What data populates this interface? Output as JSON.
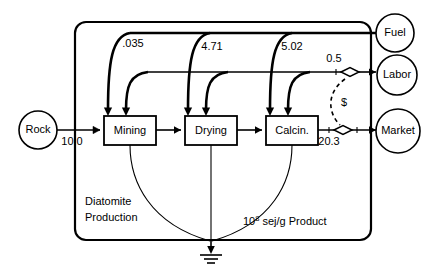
{
  "diagram": {
    "unit_note": {
      "base": "10",
      "exponent": "8",
      "suffix": " sej/g Product"
    },
    "system_boundary_label": "Diatomite Production",
    "caption_line1": "Diatomite",
    "caption_line2": "Production",
    "money_symbol": "$"
  },
  "sources": [
    {
      "id": "rock",
      "label": "Rock",
      "shape": "circle",
      "side": "left"
    },
    {
      "id": "fuel",
      "label": "Fuel",
      "shape": "circle",
      "side": "right"
    },
    {
      "id": "labor",
      "label": "Labor",
      "shape": "circle",
      "side": "right"
    },
    {
      "id": "market",
      "label": "Market",
      "shape": "circle",
      "side": "right"
    }
  ],
  "processes": [
    {
      "id": "mining",
      "label": "Mining"
    },
    {
      "id": "drying",
      "label": "Drying"
    },
    {
      "id": "calcin",
      "label": "Calcin."
    }
  ],
  "flows": [
    {
      "id": "rock-in",
      "from": "rock",
      "to": "mining",
      "value": "10.0",
      "kind": "material"
    },
    {
      "id": "fuel-mining",
      "from": "fuel",
      "to": "mining",
      "value": ".035",
      "kind": "energy"
    },
    {
      "id": "fuel-drying",
      "from": "fuel",
      "to": "drying",
      "value": "4.71",
      "kind": "energy"
    },
    {
      "id": "fuel-calcin",
      "from": "fuel",
      "to": "calcin",
      "value": "5.02",
      "kind": "energy"
    },
    {
      "id": "labor-services",
      "from": "labor",
      "to": "processes",
      "value": "0.5",
      "kind": "service"
    },
    {
      "id": "product-out",
      "from": "calcin",
      "to": "market",
      "value": "20.3",
      "kind": "product"
    }
  ],
  "labels": {
    "rock_flow": "10.0",
    "fuel_mining": ".035",
    "fuel_drying": "4.71",
    "fuel_calcin": "5.02",
    "labor_flow": "0.5",
    "product_flow": "20.3"
  },
  "symbols": {
    "ground": "heat-sink-ground",
    "transaction": "transaction-diamond",
    "money_flow": "dashed-money-line"
  },
  "colors": {
    "ink": "#000000",
    "paper": "#ffffff"
  }
}
